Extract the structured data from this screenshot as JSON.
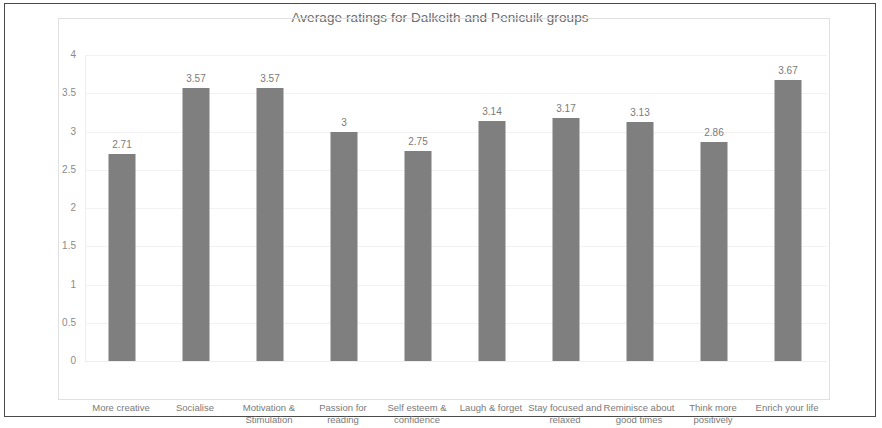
{
  "chart_data": {
    "type": "bar",
    "title": "Average ratings for Dalkeith and Penicuik groups",
    "xlabel": "",
    "ylabel": "",
    "ylim": [
      0,
      4
    ],
    "yticks": [
      "0",
      "0.5",
      "1",
      "1.5",
      "2",
      "2.5",
      "3",
      "3.5",
      "4"
    ],
    "ytick_values": [
      0,
      0.5,
      1,
      1.5,
      2,
      2.5,
      3,
      3.5,
      4
    ],
    "grid": true,
    "legend": "none",
    "bar_color": "#7f7f7f",
    "categories": [
      "More creative",
      "Socialise",
      "Motivation & Stimulation",
      "Passion for reading",
      "Self esteem & confidence",
      "Laugh & forget",
      "Stay focused and relaxed",
      "Reminisce about good times",
      "Think more positively",
      "Enrich your life"
    ],
    "values": [
      2.71,
      3.57,
      3.57,
      3,
      2.75,
      3.14,
      3.17,
      3.13,
      2.86,
      3.67
    ],
    "data_labels": [
      "2.71",
      "3.57",
      "3.57",
      "3",
      "2.75",
      "3.14",
      "3.17",
      "3.13",
      "2.86",
      "3.67"
    ]
  }
}
